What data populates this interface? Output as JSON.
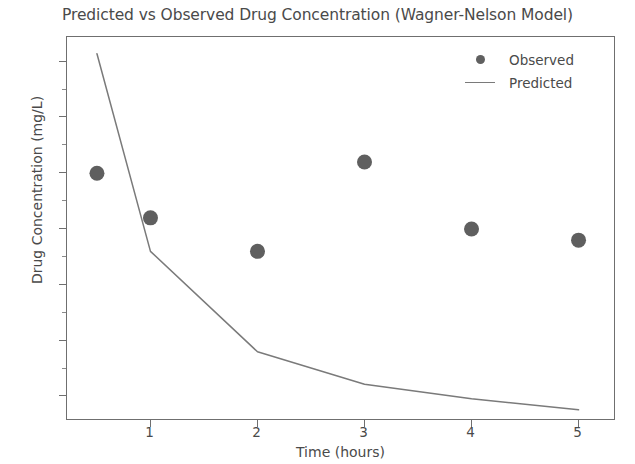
{
  "chart_data": {
    "type": "scatter",
    "title": "Predicted vs Observed Drug Concentration (Wagner-Nelson Model)",
    "xlabel": "Time (hours)",
    "ylabel": "Drug Concentration (mg/L)",
    "xlim": [
      0.22,
      5.35
    ],
    "ylim": [
      0.28,
      3.72
    ],
    "grid": false,
    "legend_position": "upper right",
    "xticks": [
      1,
      2,
      3,
      4,
      5
    ],
    "xtick_labels": [
      "1",
      "2",
      "3",
      "4",
      "5"
    ],
    "yticks": [
      0.5,
      1.0,
      1.5,
      2.0,
      2.5,
      3.0,
      3.5
    ],
    "ytick_labels": [
      "0.5",
      "1.0",
      "1.5",
      "2.0",
      "2.5",
      "3.0",
      "3.5"
    ],
    "series": [
      {
        "name": "Observed",
        "type": "scatter",
        "color": "#5f5f5f",
        "marker": "circle",
        "x": [
          0.5,
          1,
          2,
          3,
          4,
          5
        ],
        "values": [
          2.5,
          2.1,
          1.8,
          2.6,
          2.0,
          1.9
        ]
      },
      {
        "name": "Predicted",
        "type": "line",
        "color": "#7a7a7a",
        "x": [
          0.5,
          1,
          2,
          3,
          4,
          5
        ],
        "values": [
          3.57,
          1.8,
          0.9,
          0.61,
          0.48,
          0.38
        ]
      }
    ]
  },
  "legend": {
    "entries": [
      {
        "label": "Observed",
        "key": "marker-dot"
      },
      {
        "label": "Predicted",
        "key": "line-segment"
      }
    ]
  }
}
